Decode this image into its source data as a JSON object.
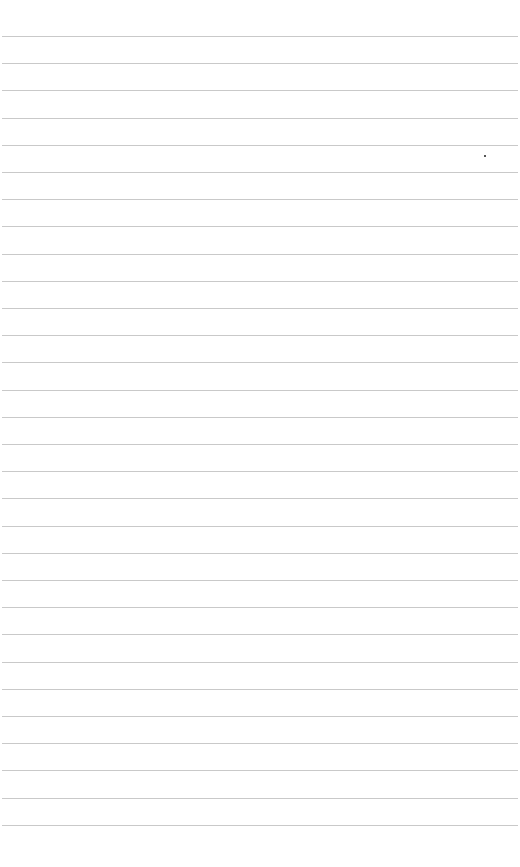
{
  "paper": {
    "background": "#ffffff",
    "line_color": "#c9c9c9",
    "first_line_y": 36,
    "line_spacing": 27.2,
    "line_count": 30,
    "mark": {
      "x": 484,
      "y": 155
    }
  }
}
